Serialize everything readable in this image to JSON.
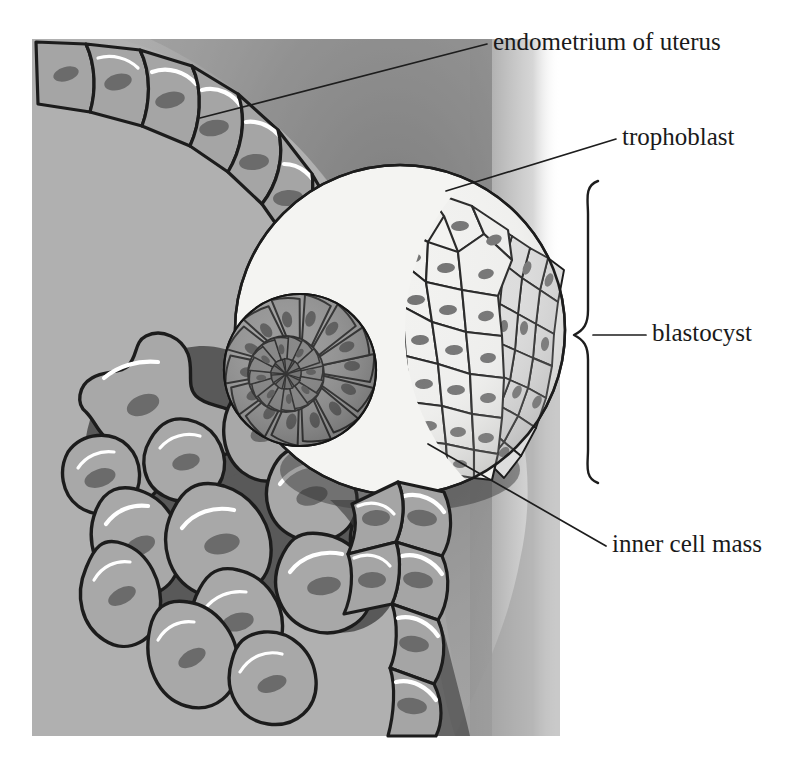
{
  "figure": {
    "background_color": "#ffffff",
    "tissue_color": "#b0b0b0",
    "shadow_color": "#8a8a8a",
    "ink_color": "#1d1d1d",
    "cell_fill": "#a5a5a5",
    "nucleus_fill": "#6b6b6b",
    "trophoblast_fill": "#f2f2f0",
    "inner_cell_mass_fill": "#8f8f8f"
  },
  "labels": [
    {
      "id": "endometrium",
      "text": "endometrium of uterus",
      "x": 493,
      "y": 44,
      "anchor": "start",
      "leader": "M 200 118 L 487 44",
      "leader_visible": true
    },
    {
      "id": "trophoblast",
      "text": "trophoblast",
      "x": 622,
      "y": 139,
      "anchor": "start",
      "leader": "M 446 191 L 616 139",
      "leader_visible": true
    },
    {
      "id": "blastocyst",
      "text": "blastocyst",
      "x": 652,
      "y": 335,
      "anchor": "start",
      "leader": "M 593 335 L 646 335",
      "leader_visible": true
    },
    {
      "id": "inner-cell-mass",
      "text": "inner cell mass",
      "x": 612,
      "y": 546,
      "anchor": "start",
      "leader": "M 428 444 L 606 546",
      "leader_visible": true
    }
  ],
  "brace": {
    "label_for": "blastocyst",
    "top_y": 181,
    "bottom_y": 483,
    "tip_y": 335,
    "x": 578,
    "tip_x": 595
  },
  "structures": [
    {
      "name": "endometrium-epithelium",
      "description": "chain of columnar epithelial cells lining the uterine surface",
      "cell_count": 19
    },
    {
      "name": "endometrial-stroma",
      "description": "irregular decidual stromal cells beneath the epithelium",
      "cell_count": 13
    },
    {
      "name": "blastocyst",
      "description": "spherical embryo partially embedded in the endometrium"
    },
    {
      "name": "trophoblast",
      "description": "outer polygonal cell layer of the blastocyst",
      "cell_count": 62
    },
    {
      "name": "inner-cell-mass",
      "description": "radially arranged cell cluster inside the blastocyst",
      "cell_count": 40
    }
  ]
}
